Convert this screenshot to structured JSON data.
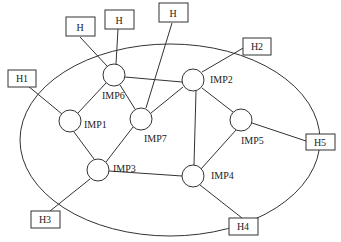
{
  "diagram": {
    "type": "network-topology",
    "subnet_boundary": "ellipse",
    "imps": [
      {
        "id": "IMP1",
        "label": "IMP1",
        "cx": 70,
        "cy": 121
      },
      {
        "id": "IMP2",
        "label": "IMP2",
        "cx": 193,
        "cy": 80
      },
      {
        "id": "IMP3",
        "label": "IMP3",
        "cx": 98,
        "cy": 170
      },
      {
        "id": "IMP4",
        "label": "IMP4",
        "cx": 193,
        "cy": 176
      },
      {
        "id": "IMP5",
        "label": "IMP5",
        "cx": 241,
        "cy": 120
      },
      {
        "id": "IMP6",
        "label": "IMP6",
        "cx": 114,
        "cy": 75
      },
      {
        "id": "IMP7",
        "label": "IMP7",
        "cx": 141,
        "cy": 119
      }
    ],
    "hosts": [
      {
        "id": "H-a",
        "label": "H",
        "x": 66,
        "y": 17
      },
      {
        "id": "H-b",
        "label": "H",
        "x": 105,
        "y": 10
      },
      {
        "id": "H-c",
        "label": "H",
        "x": 159,
        "y": 3
      },
      {
        "id": "H1",
        "label": "H1",
        "x": 8,
        "y": 70
      },
      {
        "id": "H2",
        "label": "H2",
        "x": 243,
        "y": 38
      },
      {
        "id": "H3",
        "label": "H3",
        "x": 31,
        "y": 211
      },
      {
        "id": "H4",
        "label": "H4",
        "x": 229,
        "y": 218
      },
      {
        "id": "H5",
        "label": "H5",
        "x": 306,
        "y": 135
      }
    ],
    "imp_links": [
      [
        "IMP6",
        "IMP1"
      ],
      [
        "IMP6",
        "IMP2"
      ],
      [
        "IMP6",
        "IMP7"
      ],
      [
        "IMP7",
        "IMP2"
      ],
      [
        "IMP7",
        "IMP3"
      ],
      [
        "IMP1",
        "IMP3"
      ],
      [
        "IMP3",
        "IMP4"
      ],
      [
        "IMP2",
        "IMP4"
      ],
      [
        "IMP2",
        "IMP5"
      ],
      [
        "IMP5",
        "IMP4"
      ]
    ],
    "host_links": [
      [
        "H-a",
        "IMP6"
      ],
      [
        "H-b",
        "IMP6"
      ],
      [
        "H-c",
        "IMP7"
      ],
      [
        "H1",
        "IMP1"
      ],
      [
        "H2",
        "IMP2"
      ],
      [
        "H3",
        "IMP3"
      ],
      [
        "H4",
        "IMP4"
      ],
      [
        "H5",
        "IMP5"
      ]
    ]
  }
}
